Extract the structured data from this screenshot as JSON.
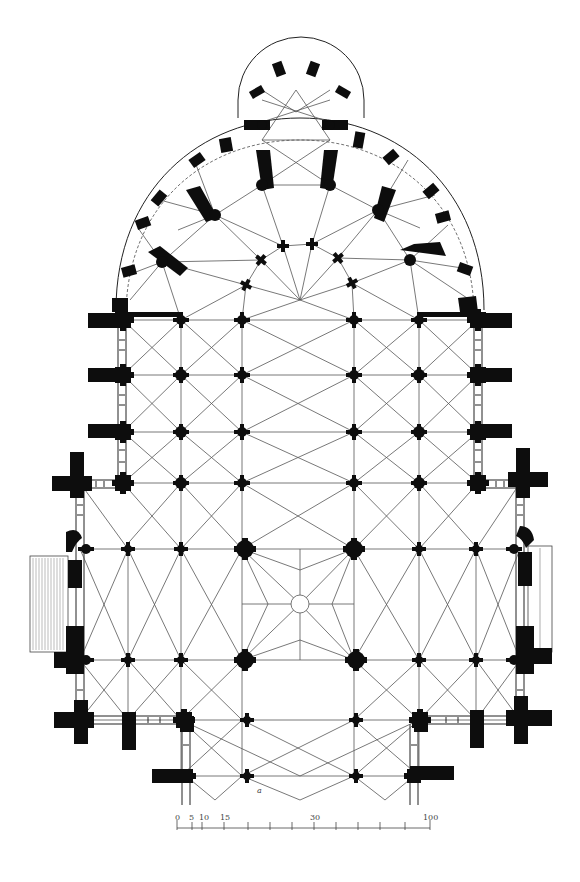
{
  "figure": {
    "type": "architectural-floor-plan",
    "colors": {
      "ink": "#0d0d0d",
      "ribs": "#555555",
      "paper": "#ffffff"
    }
  },
  "scale_bar": {
    "labels": [
      "0",
      "5",
      "10",
      "15",
      "30",
      "100"
    ],
    "label_0": "0",
    "label_5": "5",
    "label_10": "10",
    "label_15": "15",
    "label_30": "30",
    "label_100": "100"
  },
  "annotations": {
    "small_letter": "a"
  },
  "columns": {
    "rows_y": [
      320,
      375,
      432,
      483,
      549,
      660,
      720,
      776
    ],
    "cols_x": [
      123,
      181,
      242,
      354,
      419,
      478
    ]
  }
}
